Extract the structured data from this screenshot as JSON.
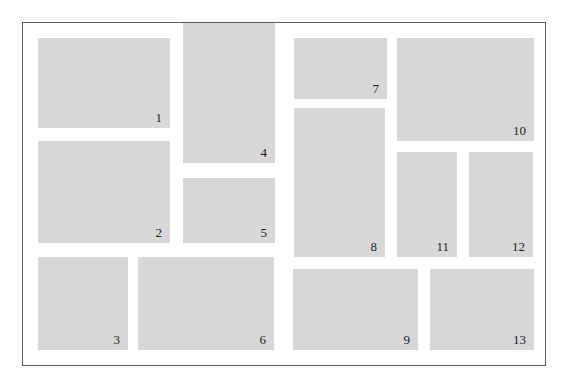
{
  "colors": {
    "background": "#ffffff",
    "block_fill": "#d8d8d8",
    "frame_border": "#5a5a5a",
    "label_text": "#1c1c1c"
  },
  "blocks": [
    {
      "label": "1"
    },
    {
      "label": "2"
    },
    {
      "label": "3"
    },
    {
      "label": "4"
    },
    {
      "label": "5"
    },
    {
      "label": "6"
    },
    {
      "label": "7"
    },
    {
      "label": "8"
    },
    {
      "label": "9"
    },
    {
      "label": "10"
    },
    {
      "label": "11"
    },
    {
      "label": "12"
    },
    {
      "label": "13"
    }
  ]
}
